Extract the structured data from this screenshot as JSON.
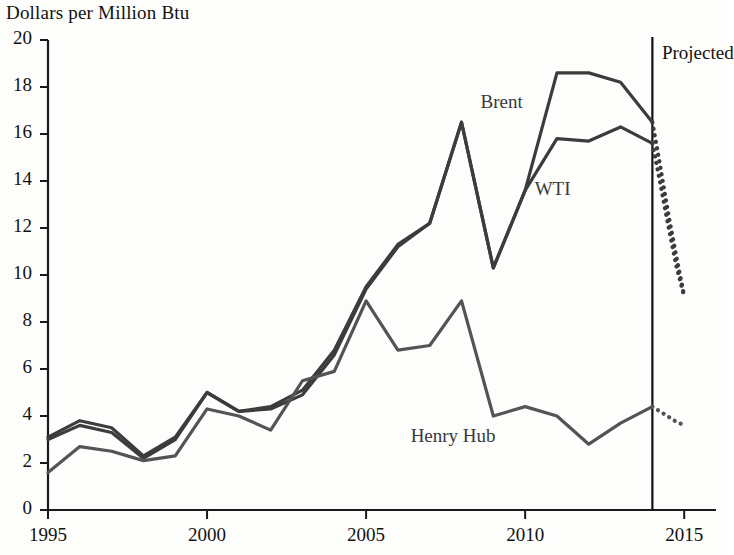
{
  "chart_data": {
    "type": "line",
    "title": "Dollars per Million Btu",
    "xlabel": "",
    "ylabel": "Dollars per Million Btu",
    "xlim": [
      1995,
      2016
    ],
    "ylim": [
      0,
      20
    ],
    "ytick_values": [
      0,
      2,
      4,
      6,
      8,
      10,
      12,
      14,
      16,
      18,
      20
    ],
    "ytick_labels": [
      "0",
      "2",
      "4",
      "6",
      "8",
      "10",
      "12",
      "14",
      "16",
      "18",
      "20"
    ],
    "xtick_values": [
      1995,
      2000,
      2005,
      2010,
      2015
    ],
    "xtick_labels": [
      "1995",
      "2000",
      "2005",
      "2010",
      "2015"
    ],
    "grid": false,
    "legend_position": "inline-annotations",
    "annotations": [
      {
        "text": "Brent",
        "x": 2008.6,
        "y": 17.3
      },
      {
        "text": "WTI",
        "x": 2010.3,
        "y": 13.6
      },
      {
        "text": "Henry Hub",
        "x": 2006.4,
        "y": 3.1
      },
      {
        "text": "Projected",
        "x": 2014.3,
        "y": 19.4
      }
    ],
    "projection_divider": {
      "label": "Projected",
      "x": 2014
    },
    "series": [
      {
        "name": "Brent",
        "color": "#3c3c3c",
        "style": "solid",
        "x": [
          1995,
          1996,
          1997,
          1998,
          1999,
          2000,
          2001,
          2002,
          2003,
          2004,
          2005,
          2006,
          2007,
          2008,
          2009,
          2010,
          2011,
          2012,
          2013,
          2014
        ],
        "values": [
          3.0,
          3.6,
          3.3,
          2.2,
          3.0,
          5.0,
          4.2,
          4.3,
          4.9,
          6.6,
          9.4,
          11.2,
          12.2,
          16.5,
          10.3,
          13.6,
          18.6,
          18.6,
          18.2,
          16.5
        ]
      },
      {
        "name": "Brent projected",
        "color": "#3c3c3c",
        "style": "dotted",
        "x": [
          2014,
          2014.25,
          2014.5,
          2014.75,
          2015
        ],
        "values": [
          16.5,
          14.6,
          12.6,
          10.8,
          9.1
        ]
      },
      {
        "name": "WTI",
        "color": "#3c3c3c",
        "style": "solid",
        "x": [
          1995,
          1996,
          1997,
          1998,
          1999,
          2000,
          2001,
          2002,
          2003,
          2004,
          2005,
          2006,
          2007,
          2008,
          2009,
          2010,
          2011,
          2012,
          2013,
          2014
        ],
        "values": [
          3.1,
          3.8,
          3.5,
          2.3,
          3.1,
          5.0,
          4.2,
          4.4,
          5.1,
          6.8,
          9.5,
          11.3,
          12.2,
          16.5,
          10.3,
          13.6,
          15.8,
          15.7,
          16.3,
          15.6
        ]
      },
      {
        "name": "WTI projected",
        "color": "#3c3c3c",
        "style": "dotted",
        "x": [
          2014,
          2014.25,
          2014.5,
          2014.75,
          2015
        ],
        "values": [
          15.6,
          13.9,
          12.1,
          10.4,
          9.1
        ]
      },
      {
        "name": "Henry Hub",
        "color": "#545454",
        "style": "solid",
        "x": [
          1995,
          1996,
          1997,
          1998,
          1999,
          2000,
          2001,
          2002,
          2003,
          2004,
          2005,
          2006,
          2007,
          2008,
          2009,
          2010,
          2011,
          2012,
          2013,
          2014
        ],
        "values": [
          1.6,
          2.7,
          2.5,
          2.1,
          2.3,
          4.3,
          4.0,
          3.4,
          5.5,
          5.9,
          8.9,
          6.8,
          7.0,
          8.9,
          4.0,
          4.4,
          4.0,
          2.8,
          3.7,
          4.4
        ]
      },
      {
        "name": "Henry Hub projected",
        "color": "#545454",
        "style": "dotted",
        "x": [
          2014,
          2014.35,
          2014.7,
          2015
        ],
        "values": [
          4.4,
          4.1,
          3.8,
          3.6
        ]
      }
    ]
  },
  "axes": {
    "title": "Dollars per Million Btu"
  }
}
